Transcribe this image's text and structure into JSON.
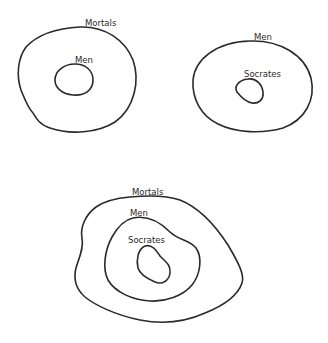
{
  "diagrams": [
    {
      "id": "top-left",
      "description": "All men are mortal",
      "sets": [
        {
          "label": "Mortals",
          "role": "outer"
        },
        {
          "label": "Men",
          "role": "inner"
        }
      ]
    },
    {
      "id": "top-right",
      "description": "Socrates is a man",
      "sets": [
        {
          "label": "Men",
          "role": "outer"
        },
        {
          "label": "Socrates",
          "role": "inner"
        }
      ]
    },
    {
      "id": "bottom",
      "description": "Therefore Socrates is mortal",
      "sets": [
        {
          "label": "Mortals",
          "role": "outer"
        },
        {
          "label": "Men",
          "role": "middle"
        },
        {
          "label": "Socrates",
          "role": "inner"
        }
      ]
    }
  ],
  "colors": {
    "stroke": "#2a2a2a",
    "background": "#ffffff"
  }
}
